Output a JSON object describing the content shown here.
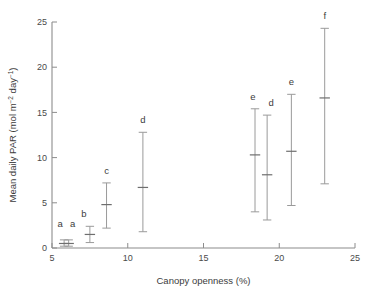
{
  "chart_data": {
    "type": "scatter",
    "title": "",
    "xlabel": "Canopy openness (%)",
    "ylabel": "Mean daily PAR (mol m-2 day-1)",
    "ylabel_parts": {
      "prefix": "Mean daily PAR (mol m",
      "sup1": "−2",
      "middle": " day",
      "sup2": "−1",
      "suffix": ")"
    },
    "xlim": [
      5,
      25
    ],
    "ylim": [
      0,
      25
    ],
    "xticks": [
      5,
      10,
      15,
      20,
      25
    ],
    "yticks": [
      0,
      5,
      10,
      15,
      20,
      25
    ],
    "xtick_labels": [
      "5",
      "10",
      "15",
      "20",
      "25"
    ],
    "ytick_labels": [
      "0",
      "5",
      "10",
      "15",
      "20",
      "25"
    ],
    "grid": false,
    "legend": "none",
    "error_style": "vertical range bars with caps and mean tick",
    "colors": {
      "axis": "#8c8c8c",
      "error_bar": "#9a9a9a",
      "mean_marker": "#6e6e6e",
      "text": "#3c3c3c",
      "background": "#ffffff"
    },
    "points": [
      {
        "label": "a",
        "x": 5.8,
        "y": 0.5,
        "low": 0.2,
        "high": 0.9,
        "label_dx": -4,
        "label_dy": -13
      },
      {
        "label": "a",
        "x": 6.1,
        "y": 0.5,
        "low": 0.2,
        "high": 0.9,
        "label_dx": 4,
        "label_dy": -13
      },
      {
        "label": "b",
        "x": 7.5,
        "y": 1.5,
        "low": 0.6,
        "high": 2.4,
        "label_dx": -6,
        "label_dy": -9
      },
      {
        "label": "c",
        "x": 8.6,
        "y": 4.8,
        "low": 2.2,
        "high": 7.2,
        "label_dx": 0,
        "label_dy": -9
      },
      {
        "label": "d",
        "x": 11.0,
        "y": 6.7,
        "low": 1.8,
        "high": 12.8,
        "label_dx": 0,
        "label_dy": -9
      },
      {
        "label": "e",
        "x": 18.4,
        "y": 10.3,
        "low": 4.0,
        "high": 15.4,
        "label_dx": -2,
        "label_dy": -9
      },
      {
        "label": "d",
        "x": 19.2,
        "y": 8.1,
        "low": 3.1,
        "high": 14.7,
        "label_dx": 4,
        "label_dy": -9
      },
      {
        "label": "e",
        "x": 20.8,
        "y": 10.7,
        "low": 4.7,
        "high": 17.0,
        "label_dx": 0,
        "label_dy": -9
      },
      {
        "label": "f",
        "x": 23.0,
        "y": 16.6,
        "low": 7.1,
        "high": 24.3,
        "label_dx": 0,
        "label_dy": -9
      }
    ]
  }
}
